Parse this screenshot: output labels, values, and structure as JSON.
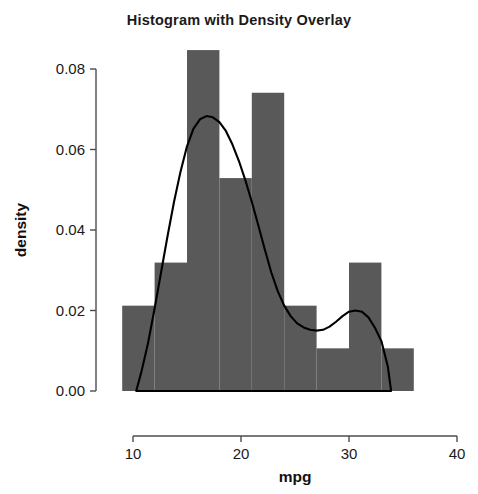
{
  "chart_data": {
    "type": "bar",
    "title": "Histogram with Density Overlay",
    "xlabel": "mpg",
    "ylabel": "density",
    "xlim": [
      5.5,
      42
    ],
    "ylim": [
      0.0,
      0.089
    ],
    "grid": false,
    "legend": null,
    "bar_color": "#595959",
    "line_color": "#000000",
    "axis_color": "#4d4d4d",
    "xticks": [
      10,
      20,
      30,
      40
    ],
    "xtick_labels": [
      "10",
      "20",
      "30",
      "40"
    ],
    "yticks": [
      0.0,
      0.02,
      0.04,
      0.06,
      0.08
    ],
    "ytick_labels": [
      "0.00",
      "0.02",
      "0.04",
      "0.06",
      "0.08"
    ],
    "bin_width": 3,
    "bin_edges": [
      9,
      12,
      15,
      18,
      21,
      24,
      27,
      30,
      33,
      36
    ],
    "categories": [
      "9-12",
      "12-15",
      "15-18",
      "18-21",
      "21-24",
      "24-27",
      "27-30",
      "30-33",
      "33-36"
    ],
    "values": [
      0.0212,
      0.0319,
      0.0847,
      0.0529,
      0.0741,
      0.0212,
      0.0106,
      0.0319,
      0.0106
    ],
    "series": [
      {
        "name": "histogram",
        "type": "bar",
        "values": [
          0.0212,
          0.0319,
          0.0847,
          0.0529,
          0.0741,
          0.0212,
          0.0106,
          0.0319,
          0.0106
        ]
      },
      {
        "name": "density",
        "type": "line",
        "x": [
          10.3,
          10.8,
          11.4,
          12.0,
          12.6,
          13.2,
          13.8,
          14.4,
          15.0,
          15.6,
          16.2,
          16.8,
          17.4,
          18.0,
          18.6,
          19.2,
          19.8,
          20.4,
          21.0,
          21.6,
          22.2,
          22.8,
          23.4,
          24.0,
          24.6,
          25.2,
          25.8,
          26.4,
          27.0,
          27.6,
          28.2,
          28.8,
          29.4,
          30.0,
          30.6,
          31.2,
          31.8,
          32.4,
          33.0,
          33.6,
          33.9
        ],
        "y": [
          0.0,
          0.005,
          0.012,
          0.0205,
          0.0295,
          0.0385,
          0.047,
          0.0545,
          0.0608,
          0.0652,
          0.0675,
          0.0683,
          0.068,
          0.0668,
          0.0646,
          0.0613,
          0.0572,
          0.0524,
          0.047,
          0.0412,
          0.0352,
          0.0295,
          0.0248,
          0.0212,
          0.0186,
          0.0168,
          0.0158,
          0.0152,
          0.015,
          0.0152,
          0.016,
          0.0172,
          0.0186,
          0.0197,
          0.02,
          0.0197,
          0.0183,
          0.0157,
          0.0124,
          0.006,
          0.0
        ]
      }
    ]
  },
  "axes": {
    "x_axis_name": "mpg-axis",
    "y_axis_name": "density-axis"
  }
}
